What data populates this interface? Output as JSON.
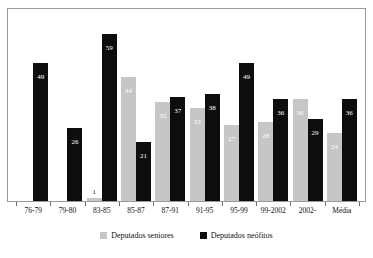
{
  "chart_data": {
    "type": "bar",
    "title": "",
    "subtitle": "",
    "xlabel": "",
    "ylabel": "",
    "ylim": [
      0,
      68
    ],
    "grid": false,
    "legend_position": "bottom",
    "categories": [
      "76-79",
      "79-80",
      "83-85",
      "85-87",
      "87-91",
      "91-95",
      "95-99",
      "99-2002",
      "2002-",
      "Média"
    ],
    "series": [
      {
        "name": "Deputados seniores",
        "color": "#c6c6c6",
        "values": [
          null,
          null,
          1,
          44,
          35,
          33,
          27,
          28,
          36,
          24
        ]
      },
      {
        "name": "Deputados neófitos",
        "color": "#0d0d0d",
        "values": [
          49,
          26,
          59,
          21,
          37,
          38,
          49,
          36,
          29,
          36
        ]
      }
    ]
  },
  "legend": {
    "items": [
      {
        "label": "Deputados seniores",
        "color": "#c6c6c6"
      },
      {
        "label": "Deputados neófitos",
        "color": "#0d0d0d"
      }
    ]
  },
  "colors": {
    "senior": "#c6c6c6",
    "neofito": "#0d0d0d",
    "frame": "#9a9a9a",
    "background": "#ffffff"
  }
}
